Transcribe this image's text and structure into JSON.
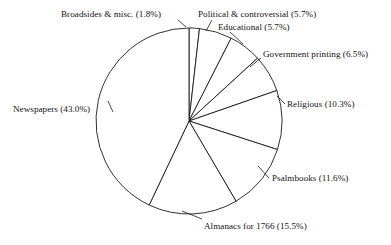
{
  "chart_data": {
    "type": "pie",
    "title": "",
    "subtitle": "",
    "xlabel": "",
    "ylabel": "",
    "legend_position": "none",
    "grid": false,
    "units": "percent",
    "start_angle_deg": 0,
    "direction": "clockwise",
    "categories": [
      "Broadsides & misc.",
      "Political & controversial",
      "Educational",
      "Government printing",
      "Religious",
      "Psalmbooks",
      "Almanacs for 1766",
      "Newspapers"
    ],
    "values": [
      1.8,
      5.7,
      5.7,
      6.5,
      10.3,
      11.6,
      15.5,
      43.0
    ],
    "slices": [
      {
        "name": "Broadsides & misc.",
        "value": 1.8,
        "label": "Broadsides & misc. (1.8%)",
        "label_x": 61,
        "label_y": 9,
        "leader": "M 178 20 L 186 27"
      },
      {
        "name": "Political & controversial",
        "value": 5.7,
        "label": "Political & controversial (5.7%)",
        "label_x": 198,
        "label_y": 9,
        "leader": "M 212 20 L 206 31"
      },
      {
        "name": "Educational",
        "value": 5.7,
        "label": "Educational (5.7%)",
        "label_x": 218,
        "label_y": 22,
        "leader": "M 230 32 L 243 44"
      },
      {
        "name": "Government printing",
        "value": 6.5,
        "label": "Government printing (6.5%)",
        "label_x": 263,
        "label_y": 49,
        "leader": "M 261 58 L 250 67"
      },
      {
        "name": "Religious",
        "value": 10.3,
        "label": "Religious (10.3%)",
        "label_x": 287,
        "label_y": 99,
        "leader": "M 285 104 L 277 96"
      },
      {
        "name": "Psalmbooks",
        "value": 11.6,
        "label": "Psalmbooks (11.6%)",
        "label_x": 272,
        "label_y": 173,
        "leader": "M 269 178 L 258 166"
      },
      {
        "name": "Almanacs for 1766",
        "value": 15.5,
        "label": "Almanacs for 1766 (15.5%)",
        "label_x": 204,
        "label_y": 221,
        "leader": "M 202 219 L 182 211"
      },
      {
        "name": "Newspapers",
        "value": 43.0,
        "label": "Newspapers (43.0%)",
        "label_x": 13,
        "label_y": 104,
        "leader": "M 108 101 L 113 112"
      }
    ],
    "geometry": {
      "center_x": 189,
      "center_y": 121,
      "radius": 93
    },
    "colors": {
      "slice_fill": "#ffffff",
      "slice_stroke": "#1a1a1a",
      "background": "#ffffff",
      "text": "#111111"
    }
  }
}
